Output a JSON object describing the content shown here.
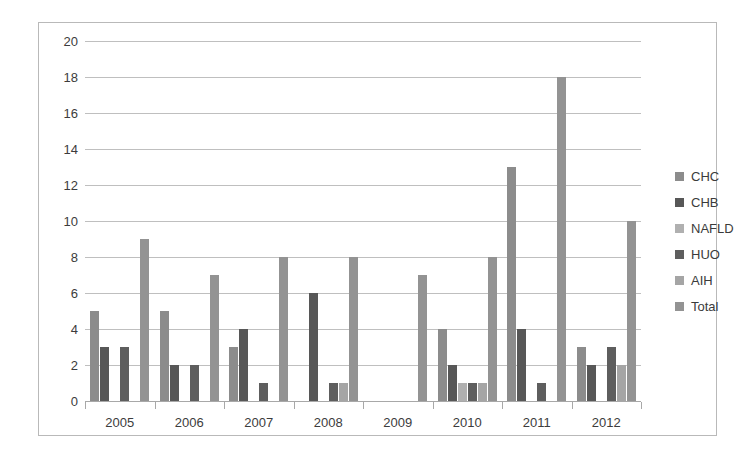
{
  "chart_data": {
    "type": "bar",
    "title": "",
    "subtitle": "",
    "xlabel": "",
    "ylabel": "",
    "categories": [
      "2005",
      "2006",
      "2007",
      "2008",
      "2009",
      "2010",
      "2011",
      "2012"
    ],
    "ylim": [
      0,
      20
    ],
    "ytick_step": 2,
    "yticks": [
      "20",
      "18",
      "16",
      "14",
      "12",
      "10",
      "8",
      "6",
      "4",
      "2",
      "0"
    ],
    "grid": true,
    "legend_position": "right",
    "series": [
      {
        "name": "CHC",
        "color": "#8c8c8c",
        "values": [
          5,
          5,
          3,
          0,
          0,
          4,
          13,
          3
        ]
      },
      {
        "name": "CHB",
        "color": "#575757",
        "values": [
          3,
          2,
          4,
          6,
          0,
          2,
          4,
          2
        ]
      },
      {
        "name": "NAFLD",
        "color": "#b0b0b0",
        "values": [
          0,
          0,
          0,
          0,
          0,
          1,
          0,
          0
        ]
      },
      {
        "name": "HUO",
        "color": "#5e5e5e",
        "values": [
          3,
          2,
          1,
          1,
          0,
          1,
          1,
          3
        ]
      },
      {
        "name": "AIH",
        "color": "#a5a5a5",
        "values": [
          0,
          0,
          0,
          1,
          0,
          1,
          0,
          2
        ]
      },
      {
        "name": "Total",
        "color": "#939393",
        "values": [
          9,
          7,
          8,
          8,
          7,
          8,
          18,
          10
        ]
      }
    ]
  },
  "legend": {
    "items": [
      {
        "label": "CHC",
        "color": "#8c8c8c"
      },
      {
        "label": "CHB",
        "color": "#575757"
      },
      {
        "label": "NAFLD",
        "color": "#b0b0b0"
      },
      {
        "label": "HUO",
        "color": "#5e5e5e"
      },
      {
        "label": "AIH",
        "color": "#a5a5a5"
      },
      {
        "label": "Total",
        "color": "#939393"
      }
    ]
  },
  "colors": {
    "grid": "#bfbfbf",
    "axis": "#a8a8a8",
    "border": "#b9b9b9",
    "text": "#3c3c3c",
    "background": "#ffffff"
  }
}
